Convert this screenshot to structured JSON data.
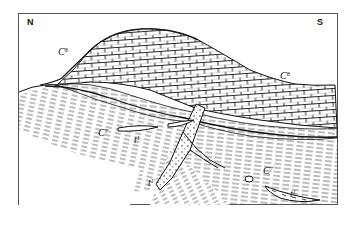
{
  "diagram": {
    "type": "geological cross-section",
    "orientation": {
      "left": "N",
      "right": "S"
    },
    "labels": [
      {
        "id": "north",
        "text": "N",
        "x": 27,
        "y": 17
      },
      {
        "id": "south",
        "text": "S",
        "x": 317,
        "y": 17
      },
      {
        "id": "c8-left",
        "base": "C",
        "sup": "8",
        "x": 58,
        "y": 47
      },
      {
        "id": "c8-right",
        "base": "C",
        "sup": "8",
        "x": 280,
        "y": 71
      },
      {
        "id": "c7-left",
        "base": "C",
        "sup": "7",
        "x": 98,
        "y": 128
      },
      {
        "id": "t1-left",
        "base": "t",
        "sup": "1",
        "x": 134,
        "y": 135
      },
      {
        "id": "t1-dike",
        "base": "t",
        "sup": "1'",
        "x": 148,
        "y": 178
      },
      {
        "id": "c7-right",
        "base": "C",
        "sup": "7",
        "x": 263,
        "y": 166
      },
      {
        "id": "t1-right",
        "base": "t",
        "sup": "1",
        "x": 290,
        "y": 189
      }
    ],
    "units": {
      "upper": "C8 — bedded limestone (brick pattern), folded anticline",
      "lower": "C7 — finely laminated strata",
      "intrusive": "t1 — lenses and dike (dotted)"
    },
    "colors": {
      "ink": "#111111",
      "paper": "#ffffff",
      "frame": "#555555"
    }
  }
}
